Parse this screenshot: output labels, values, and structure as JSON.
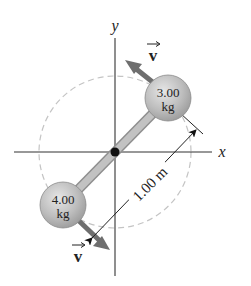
{
  "diagram": {
    "axes": {
      "x_label": "x",
      "y_label": "y"
    },
    "masses": [
      {
        "value": "3.00",
        "unit": "kg",
        "position": "upper-right"
      },
      {
        "value": "4.00",
        "unit": "kg",
        "position": "lower-left"
      }
    ],
    "velocity_labels": [
      {
        "symbol": "v",
        "position": "upper"
      },
      {
        "symbol": "v",
        "position": "lower"
      }
    ],
    "dimension": {
      "label": "1.00 m"
    },
    "colors": {
      "axis": "#333333",
      "rod": "#bdbdbd",
      "ball": "#b8b8b8",
      "arrow": "#6e6e6e",
      "dashed_circle": "#bdbdbd"
    }
  }
}
